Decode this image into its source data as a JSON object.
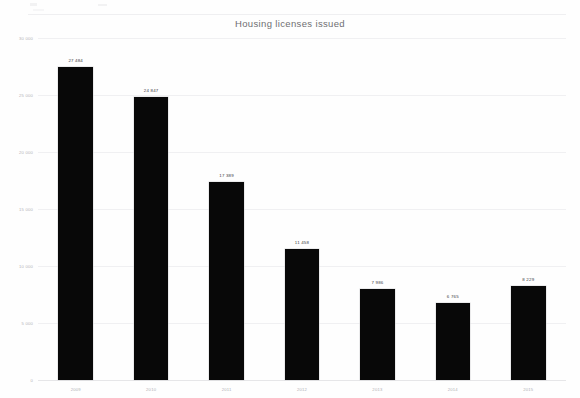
{
  "chart_data": {
    "type": "bar",
    "title": "Housing licenses issued",
    "xlabel": "",
    "ylabel": "",
    "categories": [
      "2009",
      "2010",
      "2011",
      "2012",
      "2013",
      "2014",
      "2015"
    ],
    "values": [
      27484,
      24847,
      17389,
      11458,
      7986,
      6765,
      8229
    ],
    "value_labels": [
      "27 484",
      "24 847",
      "17 389",
      "11 458",
      "7 986",
      "6 765",
      "8 229"
    ],
    "ylim": [
      0,
      30000
    ],
    "yticks": [
      0,
      5000,
      10000,
      15000,
      20000,
      25000,
      30000
    ],
    "ytick_labels": [
      "0",
      "5 000",
      "10 000",
      "15 000",
      "20 000",
      "25 000",
      "30 000"
    ],
    "grid": true,
    "legend": false,
    "bar_color": "#080808",
    "grid_color": "#f0f0f2",
    "title_color": "#6e6e72",
    "tick_color": "#b4b4b8"
  }
}
